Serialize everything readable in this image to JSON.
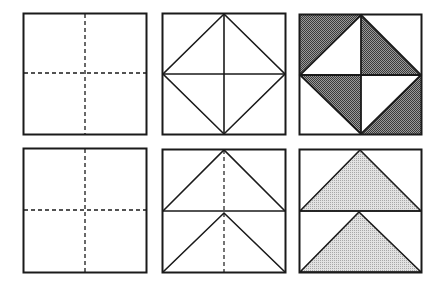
{
  "figure": {
    "colors": {
      "line": "#1a1a1a",
      "dark_fill": "#6e6e6e",
      "light_fill": "#c8c8c8",
      "background": "#ffffff"
    },
    "rows": [
      {
        "name": "row-1",
        "panels": [
          {
            "step": 1,
            "content": "square with dashed vertical and horizontal center fold lines"
          },
          {
            "step": 2,
            "content": "square with solid center cross and inscribed diamond connecting edge midpoints"
          },
          {
            "step": 3,
            "content": "diamond-in-square with alternating shaded triangles (pinwheel)"
          }
        ]
      },
      {
        "name": "row-2",
        "panels": [
          {
            "step": 1,
            "content": "square with dashed vertical and horizontal center fold lines"
          },
          {
            "step": 2,
            "content": "square split into two horizontal halves, each with an upward triangle; dashed vertical center line"
          },
          {
            "step": 3,
            "content": "two horizontal halves each containing a shaded upward triangle"
          }
        ]
      }
    ]
  }
}
